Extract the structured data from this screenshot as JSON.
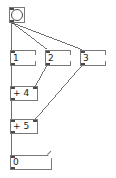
{
  "window": {
    "app": "Pure Data",
    "type": "patch-canvas",
    "background": "#ffffff",
    "width": 116,
    "height": 178
  },
  "style": {
    "object_border": "#787878",
    "wire_color": "#4a4a4a",
    "text_color": "#1a1a1a",
    "nub_color": "#4a4a4a"
  },
  "objects": [
    {
      "id": "bang",
      "kind": "bang",
      "label": "",
      "x": 9,
      "y": 7,
      "w": 16,
      "h": 16
    },
    {
      "id": "msg1",
      "kind": "message",
      "label": "1",
      "x": 10,
      "y": 50,
      "w": 26,
      "h": 16
    },
    {
      "id": "msg2",
      "kind": "message",
      "label": "2",
      "x": 45,
      "y": 50,
      "w": 26,
      "h": 16
    },
    {
      "id": "msg3",
      "kind": "message",
      "label": "3",
      "x": 80,
      "y": 50,
      "w": 26,
      "h": 16
    },
    {
      "id": "plus4",
      "kind": "object",
      "label": "+ 4",
      "x": 10,
      "y": 86,
      "w": 28,
      "h": 15
    },
    {
      "id": "plus5",
      "kind": "object",
      "label": "+ 5",
      "x": 10,
      "y": 119,
      "w": 28,
      "h": 15
    },
    {
      "id": "numbox",
      "kind": "number",
      "label": "0",
      "x": 10,
      "y": 155,
      "w": 42,
      "h": 15
    }
  ],
  "connections": [
    {
      "from": "bang",
      "from_outlet": 0,
      "to": "msg1",
      "to_inlet": 0
    },
    {
      "from": "bang",
      "from_outlet": 0,
      "to": "msg2",
      "to_inlet": 0
    },
    {
      "from": "bang",
      "from_outlet": 0,
      "to": "msg3",
      "to_inlet": 0
    },
    {
      "from": "msg1",
      "from_outlet": 0,
      "to": "plus4",
      "to_inlet": 0
    },
    {
      "from": "msg2",
      "from_outlet": 0,
      "to": "plus4",
      "to_inlet": 1
    },
    {
      "from": "msg3",
      "from_outlet": 0,
      "to": "plus5",
      "to_inlet": 1
    },
    {
      "from": "plus4",
      "from_outlet": 0,
      "to": "plus5",
      "to_inlet": 0
    },
    {
      "from": "plus5",
      "from_outlet": 0,
      "to": "numbox",
      "to_inlet": 0
    }
  ]
}
